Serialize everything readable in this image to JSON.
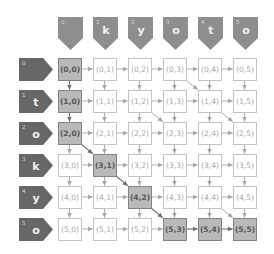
{
  "diagram": {
    "colors": {
      "background": "#ffffff",
      "col_header_fill": "#8e8e8e",
      "row_header_fill": "#676767",
      "header_text": "#f2f2f2",
      "header_index_text": "#d8d8d8",
      "cell_fill": "#ffffff",
      "cell_border": "#bdbdbd",
      "cell_text": "#a8a8a8",
      "path_cell_fill": "#b9b9b9",
      "path_cell_border": "#7a7a7a",
      "path_cell_text": "#555555",
      "arrow": "#a6a6a6",
      "path_arrow": "#6f6f6f"
    },
    "column_headers": [
      {
        "index": "0",
        "char": ""
      },
      {
        "index": "1",
        "char": "k"
      },
      {
        "index": "2",
        "char": "y"
      },
      {
        "index": "3",
        "char": "o"
      },
      {
        "index": "4",
        "char": "t"
      },
      {
        "index": "5",
        "char": "o"
      }
    ],
    "row_headers": [
      {
        "index": "0",
        "char": ""
      },
      {
        "index": "1",
        "char": "t"
      },
      {
        "index": "2",
        "char": "o"
      },
      {
        "index": "3",
        "char": "k"
      },
      {
        "index": "4",
        "char": "y"
      },
      {
        "index": "5",
        "char": "o"
      }
    ],
    "rows": 6,
    "cols": 6,
    "cell_label_format": "(r,c)",
    "highlighted_path": [
      [
        0,
        0
      ],
      [
        1,
        0
      ],
      [
        2,
        0
      ],
      [
        3,
        1
      ],
      [
        4,
        2
      ],
      [
        5,
        3
      ],
      [
        5,
        4
      ],
      [
        5,
        5
      ]
    ],
    "diagonal_arrows": [
      [
        [
          0,
          3
        ],
        [
          1,
          4
        ]
      ],
      [
        [
          1,
          2
        ],
        [
          2,
          3
        ]
      ],
      [
        [
          1,
          4
        ],
        [
          2,
          5
        ]
      ],
      [
        [
          2,
          0
        ],
        [
          3,
          1
        ]
      ],
      [
        [
          3,
          1
        ],
        [
          4,
          2
        ]
      ],
      [
        [
          4,
          2
        ],
        [
          5,
          3
        ]
      ],
      [
        [
          4,
          4
        ],
        [
          5,
          5
        ]
      ]
    ],
    "path_arrows": [
      [
        [
          0,
          0
        ],
        [
          1,
          0
        ]
      ],
      [
        [
          1,
          0
        ],
        [
          2,
          0
        ]
      ],
      [
        [
          2,
          0
        ],
        [
          3,
          1
        ]
      ],
      [
        [
          3,
          1
        ],
        [
          4,
          2
        ]
      ],
      [
        [
          4,
          2
        ],
        [
          5,
          3
        ]
      ],
      [
        [
          5,
          3
        ],
        [
          5,
          4
        ]
      ],
      [
        [
          5,
          4
        ],
        [
          5,
          5
        ]
      ]
    ]
  }
}
